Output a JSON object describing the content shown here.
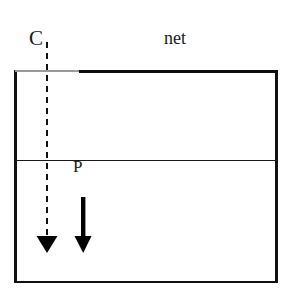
{
  "figure": {
    "background_color": "#ffffff",
    "width": 289,
    "height": 300
  },
  "labels": {
    "c": "C",
    "net": "net",
    "p": "P"
  },
  "colors": {
    "stroke": "#111111",
    "light_stroke": "#9a9a9a",
    "net_stroke": "#0d0d0d",
    "arrow_fill": "#000000",
    "background": "#ffffff"
  },
  "geometry": {
    "outer_rect": {
      "x": 15,
      "y": 71,
      "width": 262,
      "height": 212
    },
    "mid_line_y": 160,
    "net_start_x": 80,
    "net_end_x": 277,
    "dashed_line_x": 47,
    "dashed_line_top_y": 42,
    "dashed_line_bottom_y": 237,
    "solid_arrow_x": 83,
    "solid_arrow_top_y": 197,
    "solid_arrow_bottom_y": 252
  },
  "elements": {
    "outer_rectangle": "outer-rectangle",
    "net_line": "net-line",
    "top_light_line": "top-light-line",
    "mid_line": "mid-horizontal-line",
    "dashed_arrow": "dashed-vertical-arrow",
    "solid_arrow": "solid-down-arrow"
  }
}
